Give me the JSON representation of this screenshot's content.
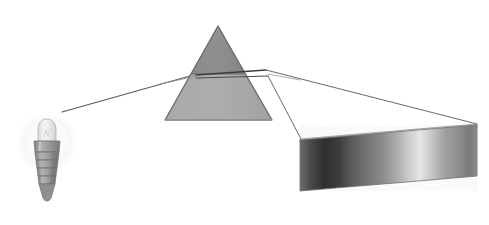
{
  "figure": {
    "background_color": "#ffffff",
    "width": 489,
    "height": 225
  },
  "light_source": {
    "label": "incandescent light bulb",
    "icon": "lightbulb-icon",
    "glow_color": "#f2f2f2",
    "glass_color": "#e8e8e8",
    "base_color": "#9a9a9a",
    "center_x": 47,
    "center_y": 155,
    "glow_radius": 33
  },
  "prism": {
    "label": "triangular glass prism",
    "icon": "triangle-icon",
    "apex_x": 218,
    "apex_y": 26,
    "base_left_x": 165,
    "base_right_x": 272,
    "base_y": 120,
    "upper_fill": "#8c8c8c",
    "lower_fill": "#a6a6a6",
    "outline_color": "#6e6e6e",
    "split_y": 74
  },
  "incident_ray": {
    "label": "incident white light ray",
    "color": "#5a5a5a",
    "from_x": 62,
    "from_y": 112,
    "to_x": 196,
    "to_y": 74,
    "width": 1.2
  },
  "refracted_rays": [
    {
      "label": "upper refracted ray",
      "color": "#5a5a5a",
      "from_x": 196,
      "from_y": 74,
      "to_x": 476,
      "to_y": 126,
      "width": 1.1
    },
    {
      "label": "lower refracted ray",
      "color": "#5a5a5a",
      "from_x": 196,
      "from_y": 78,
      "to_x": 300,
      "to_y": 139,
      "width": 1.1
    },
    {
      "label": "prism exit ray upper",
      "color": "#6a6a6a",
      "from_x": 262,
      "from_y": 72,
      "to_x": 300,
      "to_y": 139,
      "width": 1.0
    }
  ],
  "spectrum_band": {
    "label": "dispersed spectrum band",
    "left_x": 300,
    "right_x": 477,
    "top_y_left": 139,
    "top_y_right": 124,
    "bottom_y_left": 191,
    "bottom_y_right": 176,
    "edge_color": "#787878",
    "top_face_color": "#dcdcdc",
    "gradient_stops": [
      {
        "offset": 0,
        "color": "#6d6d6d"
      },
      {
        "offset": 6,
        "color": "#4a4a4a"
      },
      {
        "offset": 14,
        "color": "#2e2e2e"
      },
      {
        "offset": 22,
        "color": "#3d3d3d"
      },
      {
        "offset": 30,
        "color": "#5e5e5e"
      },
      {
        "offset": 38,
        "color": "#737373"
      },
      {
        "offset": 46,
        "color": "#8a8a8a"
      },
      {
        "offset": 54,
        "color": "#a8a8a8"
      },
      {
        "offset": 62,
        "color": "#cfcfcf"
      },
      {
        "offset": 68,
        "color": "#e6e6e6"
      },
      {
        "offset": 74,
        "color": "#c8c8c8"
      },
      {
        "offset": 82,
        "color": "#a0a0a0"
      },
      {
        "offset": 90,
        "color": "#8d8d8d"
      },
      {
        "offset": 96,
        "color": "#7a7a7a"
      },
      {
        "offset": 100,
        "color": "#8f8f8f"
      }
    ]
  },
  "bulb_geometry": {
    "glass_top_y": 120,
    "glass_width": 17,
    "collar_y": 143,
    "thread_count": 4,
    "tip_y": 205
  }
}
